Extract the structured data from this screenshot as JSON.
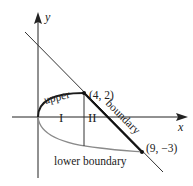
{
  "diagram": {
    "axes": {
      "x_label": "x",
      "y_label": "y"
    },
    "points": [
      {
        "label": "(4, 2)"
      },
      {
        "label": "(9, −3)"
      }
    ],
    "curve_labels": {
      "upper": "upper",
      "boundary": "boundary",
      "lower": "lower boundary"
    },
    "regions": [
      "I",
      "II"
    ],
    "colors": {
      "axis": "#222222",
      "upper_curve": "#1a1a1a",
      "lower_curve": "#8a8a8a",
      "line": "#333333"
    }
  }
}
